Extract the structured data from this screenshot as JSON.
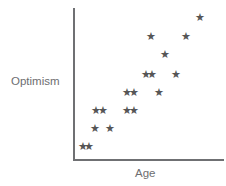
{
  "figure": {
    "axis_color": "#6f7073",
    "marker_color": "#565656",
    "label_color": "#6d6e71",
    "background": "#ffffff"
  },
  "labels": {
    "y_axis": "Optimism",
    "x_axis": "Age"
  },
  "chart_data": {
    "type": "scatter",
    "title": "",
    "xlabel": "Age",
    "ylabel": "Optimism",
    "xlim": [
      0,
      100
    ],
    "ylim": [
      0,
      100
    ],
    "grid": false,
    "legend": null,
    "marker": "star",
    "n_points": 18,
    "points_px": [
      {
        "x": 83,
        "y": 146
      },
      {
        "x": 89,
        "y": 146
      },
      {
        "x": 95,
        "y": 128
      },
      {
        "x": 110,
        "y": 128
      },
      {
        "x": 96,
        "y": 110
      },
      {
        "x": 103,
        "y": 110
      },
      {
        "x": 127,
        "y": 110
      },
      {
        "x": 134,
        "y": 110
      },
      {
        "x": 127,
        "y": 92
      },
      {
        "x": 134,
        "y": 92
      },
      {
        "x": 159,
        "y": 92
      },
      {
        "x": 146,
        "y": 74
      },
      {
        "x": 152,
        "y": 74
      },
      {
        "x": 176,
        "y": 74
      },
      {
        "x": 165,
        "y": 54
      },
      {
        "x": 151,
        "y": 36
      },
      {
        "x": 186,
        "y": 36
      },
      {
        "x": 200,
        "y": 17
      }
    ],
    "x": [
      7,
      11,
      15,
      24,
      16,
      20,
      36,
      40,
      36,
      40,
      57,
      48,
      52,
      68,
      61,
      52,
      75,
      84
    ],
    "y": [
      10,
      10,
      22,
      22,
      34,
      34,
      34,
      34,
      45,
      45,
      45,
      57,
      57,
      57,
      70,
      82,
      82,
      94
    ],
    "marker_glyph": "★"
  }
}
